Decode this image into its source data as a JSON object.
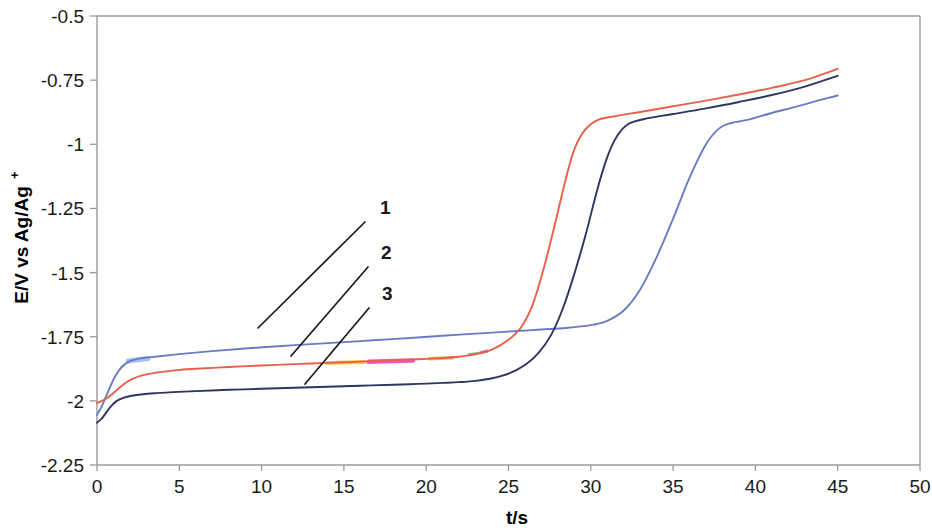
{
  "figure": {
    "title": "",
    "background_color": "#FFFFFF"
  },
  "axes": {
    "x_title": "t/s",
    "y_title_main": "E/V vs Ag/Ag",
    "y_title_superscript": "+",
    "x_ticks": [
      "0",
      "5",
      "10",
      "15",
      "20",
      "25",
      "30",
      "35",
      "40",
      "45",
      "50"
    ],
    "y_ticks": [
      "-0.5",
      "-0.75",
      "-1",
      "-1.25",
      "-1.5",
      "-1.75",
      "-2",
      "-2.25"
    ],
    "frame_color": "#9A9A9A"
  },
  "annotations": {
    "labels": [
      {
        "text": "1",
        "x": 380,
        "y": 214,
        "line_x1": 365,
        "line_y1": 222,
        "line_x2": 258,
        "line_y2": 328
      },
      {
        "text": "2",
        "x": 381,
        "y": 259,
        "line_x1": 368,
        "line_y1": 267,
        "line_x2": 291,
        "line_y2": 356
      },
      {
        "text": "3",
        "x": 382,
        "y": 300,
        "line_x1": 369,
        "line_y1": 308,
        "line_x2": 305,
        "line_y2": 384
      }
    ]
  },
  "chart_data": {
    "type": "line",
    "title": "",
    "xlabel": "t/s",
    "ylabel": "E/V vs Ag/Ag+",
    "xlim": [
      0,
      50
    ],
    "ylim": [
      -2.25,
      -0.5
    ],
    "x_tick_values": [
      0,
      5,
      10,
      15,
      20,
      25,
      30,
      35,
      40,
      45,
      50
    ],
    "y_tick_values": [
      -0.5,
      -0.75,
      -1,
      -1.25,
      -1.5,
      -1.75,
      -2,
      -2.25
    ],
    "grid": false,
    "legend_position": "inline-annotations",
    "series": [
      {
        "name": "1",
        "color": "#6B7BC4",
        "x": [
          0.0,
          0.3,
          0.7,
          1.1,
          1.5,
          2.0,
          2.6,
          3.5,
          5.0,
          7.0,
          9.0,
          11.0,
          13.0,
          15.0,
          17.0,
          19.0,
          21.0,
          22.5,
          24.0,
          25.5,
          27.0,
          28.5,
          30.0,
          31.0,
          32.0,
          33.0,
          34.0,
          35.0,
          36.0,
          37.0,
          37.8,
          38.5,
          39.5,
          41.0,
          42.5,
          44.0,
          45.0
        ],
        "y": [
          -2.055,
          -2.02,
          -1.96,
          -1.905,
          -1.868,
          -1.845,
          -1.835,
          -1.828,
          -1.818,
          -1.806,
          -1.796,
          -1.787,
          -1.779,
          -1.771,
          -1.763,
          -1.755,
          -1.746,
          -1.74,
          -1.734,
          -1.728,
          -1.722,
          -1.716,
          -1.705,
          -1.688,
          -1.648,
          -1.566,
          -1.44,
          -1.29,
          -1.13,
          -1.0,
          -0.938,
          -0.918,
          -0.905,
          -0.878,
          -0.853,
          -0.826,
          -0.81
        ]
      },
      {
        "name": "2",
        "color": "#E8604C",
        "x": [
          0.0,
          0.3,
          0.6,
          0.9,
          1.2,
          1.6,
          2.1,
          2.8,
          3.6,
          4.6,
          6.0,
          8.0,
          10.0,
          12.0,
          14.0,
          16.0,
          18.0,
          19.5,
          21.0,
          22.0,
          23.0,
          24.0,
          25.0,
          25.8,
          26.5,
          27.2,
          27.9,
          28.5,
          29.0,
          29.6,
          30.4,
          31.5,
          33.0,
          35.0,
          37.0,
          39.0,
          41.0,
          43.0,
          45.0
        ],
        "y": [
          -2.008,
          -2.0,
          -1.99,
          -1.975,
          -1.958,
          -1.936,
          -1.916,
          -1.9,
          -1.89,
          -1.882,
          -1.875,
          -1.868,
          -1.862,
          -1.857,
          -1.852,
          -1.847,
          -1.842,
          -1.838,
          -1.833,
          -1.828,
          -1.818,
          -1.8,
          -1.762,
          -1.71,
          -1.62,
          -1.47,
          -1.29,
          -1.13,
          -1.02,
          -0.948,
          -0.906,
          -0.89,
          -0.874,
          -0.852,
          -0.83,
          -0.806,
          -0.78,
          -0.75,
          -0.706
        ]
      },
      {
        "name": "3",
        "color": "#2E3560",
        "x": [
          0.0,
          0.3,
          0.6,
          0.9,
          1.2,
          1.6,
          2.1,
          2.8,
          3.6,
          4.6,
          6.0,
          8.0,
          10.0,
          12.0,
          14.0,
          16.0,
          18.0,
          19.5,
          21.0,
          22.0,
          23.0,
          24.0,
          25.0,
          26.0,
          26.8,
          27.6,
          28.3,
          29.0,
          29.7,
          30.4,
          31.0,
          31.6,
          32.3,
          33.5,
          35.0,
          37.0,
          39.0,
          41.0,
          43.0,
          45.0
        ],
        "y": [
          -2.085,
          -2.068,
          -2.042,
          -2.018,
          -2.0,
          -1.988,
          -1.98,
          -1.974,
          -1.97,
          -1.966,
          -1.962,
          -1.957,
          -1.953,
          -1.949,
          -1.945,
          -1.941,
          -1.937,
          -1.934,
          -1.93,
          -1.927,
          -1.922,
          -1.912,
          -1.894,
          -1.86,
          -1.815,
          -1.742,
          -1.64,
          -1.505,
          -1.35,
          -1.175,
          -1.05,
          -0.968,
          -0.92,
          -0.898,
          -0.882,
          -0.86,
          -0.835,
          -0.808,
          -0.775,
          -0.733
        ]
      }
    ],
    "scan_artifacts": [
      {
        "color": "#F2B705",
        "x1": 14.0,
        "y1": -1.852,
        "x2": 16.2,
        "y2": -1.849,
        "width": 4.0
      },
      {
        "color": "#E817B0",
        "x1": 16.5,
        "y1": -1.848,
        "x2": 19.2,
        "y2": -1.843,
        "width": 4.5
      },
      {
        "color": "#D9A21A",
        "x1": 20.2,
        "y1": -1.836,
        "x2": 21.6,
        "y2": -1.832,
        "width": 3.5
      },
      {
        "color": "#2FA84F",
        "x1": 22.6,
        "y1": -1.82,
        "x2": 23.1,
        "y2": -1.815,
        "width": 3.0
      },
      {
        "color": "#C030C8",
        "x1": 23.3,
        "y1": -1.812,
        "x2": 23.7,
        "y2": -1.806,
        "width": 3.0
      },
      {
        "color": "#7FA8E8",
        "x1": 1.9,
        "y1": -1.845,
        "x2": 3.1,
        "y2": -1.835,
        "width": 5.0
      }
    ]
  }
}
